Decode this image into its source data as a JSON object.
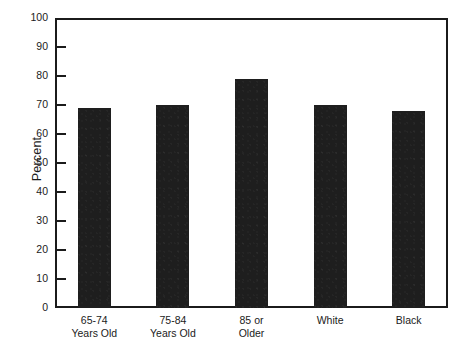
{
  "chart_data": {
    "type": "bar",
    "title": "",
    "subtitle": "",
    "xlabel": "",
    "ylabel": "Percent",
    "categories": [
      "65-74 Years Old",
      "75-84 Years Old",
      "85 or Older",
      "White",
      "Black"
    ],
    "category_lines": [
      [
        "65-74",
        "Years Old"
      ],
      [
        "75-84",
        "Years Old"
      ],
      [
        "85 or",
        "Older"
      ],
      [
        "White",
        ""
      ],
      [
        "Black",
        ""
      ]
    ],
    "values": [
      69,
      70,
      79,
      70,
      68
    ],
    "ylim": [
      0,
      100
    ],
    "ytick_step": 10,
    "ytick_labels": [
      "100",
      "90",
      "80",
      "70",
      "60",
      "50",
      "40",
      "30",
      "20",
      "10",
      "0"
    ],
    "ytick_values": [
      100,
      90,
      80,
      70,
      60,
      50,
      40,
      30,
      20,
      10,
      0
    ],
    "grid": false,
    "legend": null,
    "legend_position": "none",
    "bar_color": "#1e1e1e",
    "axis_color": "#1b1b1b",
    "background_color": "#ffffff"
  }
}
